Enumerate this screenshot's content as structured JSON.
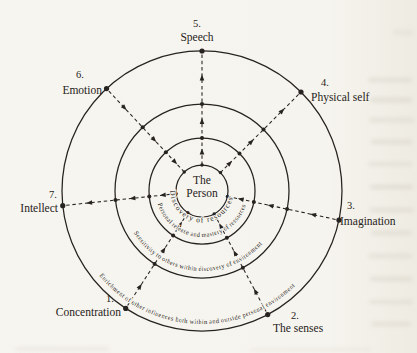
{
  "colors": {
    "paper": "#f6f4ee",
    "ink": "#262320"
  },
  "diagram": {
    "center": {
      "x": 202,
      "y": 191,
      "label_line1": "The",
      "label_line2": "Person"
    },
    "circle_radii": [
      26,
      53,
      87,
      140
    ],
    "ring_texts": [
      {
        "name": "ring-text-discovery",
        "text": "Discovery of resources",
        "radius": 31.5,
        "arc_start_deg": 215,
        "arc_end_deg": -15,
        "large_arc": 1,
        "offset": "52%",
        "font_size": 7.5,
        "letter_spacing": 1.1
      },
      {
        "name": "ring-text-personal-release",
        "text": "Personal release and mastery of resources",
        "radius": 46,
        "arc_start_deg": 180,
        "arc_end_deg": 0,
        "large_arc": 0,
        "offset": "49.5%",
        "font_size": 6.5,
        "letter_spacing": 0.2
      },
      {
        "name": "ring-text-sensitivity",
        "text": "Sensitivity to others within discovery of environment",
        "radius": 80,
        "arc_start_deg": 170,
        "arc_end_deg": 10,
        "large_arc": 0,
        "offset": "47%",
        "font_size": 6.5,
        "letter_spacing": 0.2
      },
      {
        "name": "ring-text-enrichment",
        "text": "Enrichment of other influences both within and outside personal environment",
        "radius": 133,
        "arc_start_deg": 165,
        "arc_end_deg": 15,
        "large_arc": 0,
        "offset": "48%",
        "font_size": 6.5,
        "letter_spacing": 0.25
      }
    ],
    "spokes": [
      {
        "id": "speech",
        "number": "5.",
        "label": "Speech",
        "angle_deg": 270,
        "arrow": "outward",
        "number_pos": [
          197,
          27
        ],
        "number_anchor": "middle",
        "label_pos": [
          197,
          41
        ],
        "label_anchor": "middle"
      },
      {
        "id": "physical-self",
        "number": "4.",
        "label": "Physical self",
        "angle_deg": 315,
        "arrow": "outward",
        "number_pos": [
          321,
          86
        ],
        "number_anchor": "start",
        "label_pos": [
          311,
          101
        ],
        "label_anchor": "start"
      },
      {
        "id": "imagination",
        "number": "3.",
        "label": "Imagination",
        "angle_deg": 12,
        "arrow": "inward",
        "number_pos": [
          347,
          209
        ],
        "number_anchor": "start",
        "label_pos": [
          340,
          225
        ],
        "label_anchor": "start"
      },
      {
        "id": "the-senses",
        "number": "2.",
        "label": "The senses",
        "angle_deg": 62,
        "arrow": "inward",
        "number_pos": [
          291,
          319
        ],
        "number_anchor": "start",
        "label_pos": [
          273,
          332
        ],
        "label_anchor": "start"
      },
      {
        "id": "concentration",
        "number": "1.",
        "label": "Concentration",
        "angle_deg": 123,
        "arrow": "inward",
        "number_pos": [
          110,
          302
        ],
        "number_anchor": "middle",
        "label_pos": [
          121,
          316
        ],
        "label_anchor": "end"
      },
      {
        "id": "intellect",
        "number": "7.",
        "label": "Intellect",
        "angle_deg": 174,
        "arrow": "outward",
        "number_pos": [
          53,
          198
        ],
        "number_anchor": "middle",
        "label_pos": [
          58,
          212
        ],
        "label_anchor": "end"
      },
      {
        "id": "emotion",
        "number": "6.",
        "label": "Emotion",
        "angle_deg": 227,
        "arrow": "inward",
        "number_pos": [
          80,
          78
        ],
        "number_anchor": "middle",
        "label_pos": [
          102,
          94
        ],
        "label_anchor": "end"
      }
    ],
    "arrow_mid_radii": [
      39.5,
      70,
      113.5
    ],
    "dot_radii": {
      "inner": 1.7,
      "mid": 2.0,
      "outer": 2.6
    }
  }
}
